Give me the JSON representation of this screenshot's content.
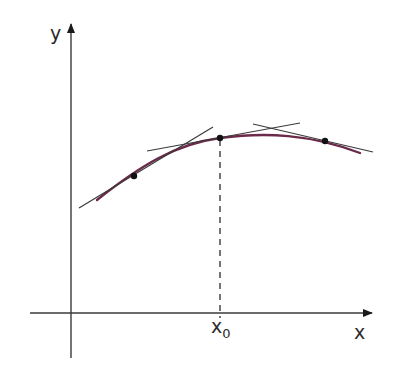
{
  "diagram": {
    "colors": {
      "background": "#ffffff",
      "axis": "#3a3a3a",
      "curve": "#6b2a4a",
      "tangent": "#3a3a3a",
      "point": "#111111",
      "dashed": "#3a3a3a"
    },
    "axes": {
      "x_label": "x",
      "y_label": "y",
      "origin_px": [
        71,
        313
      ],
      "x_axis_extent_px": [
        30,
        371
      ],
      "y_axis_extent_px": [
        25,
        358
      ]
    },
    "marker": {
      "label_main": "x",
      "label_sub": "0",
      "x_px": 220
    },
    "curve": {
      "description": "concave-down smooth curve",
      "start_px": [
        97,
        200
      ],
      "end_px": [
        360,
        153
      ]
    },
    "points": [
      {
        "name": "p1",
        "x_px": 134,
        "y_px": 176
      },
      {
        "name": "p2-x0",
        "x_px": 220,
        "y_px": 138
      },
      {
        "name": "p3",
        "x_px": 325,
        "y_px": 141
      }
    ],
    "tangents": [
      {
        "at": "p1",
        "from_px": [
          79,
          208
        ],
        "to_px": [
          213,
          127
        ]
      },
      {
        "at": "p2-x0",
        "from_px": [
          147,
          151
        ],
        "to_px": [
          300,
          123
        ]
      },
      {
        "at": "p3",
        "from_px": [
          253,
          124
        ],
        "to_px": [
          373,
          152
        ]
      }
    ]
  }
}
